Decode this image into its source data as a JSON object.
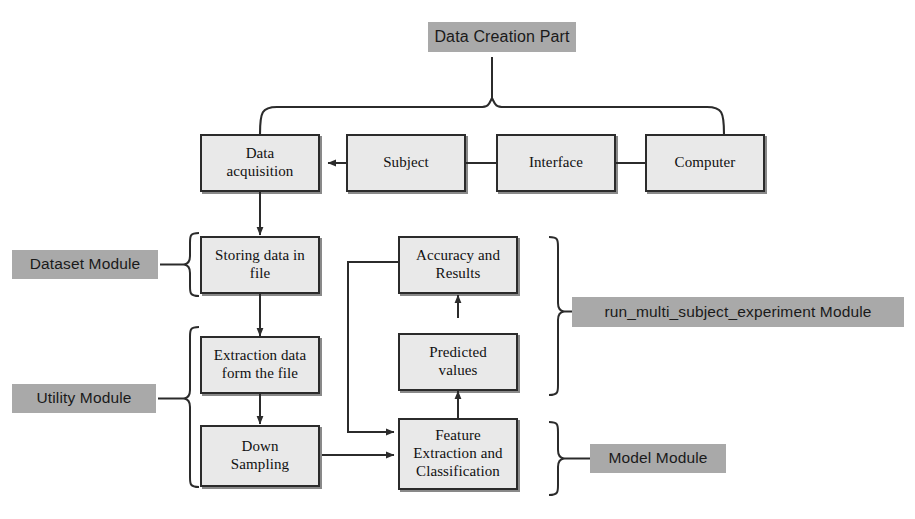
{
  "diagram": {
    "title": "Data Creation Part",
    "nodes": {
      "computer": "Computer",
      "interface": "Interface",
      "subject": "Subject",
      "data_acquisition_line1": "Data",
      "data_acquisition_line2": "acquisition",
      "storing_line1": "Storing data in",
      "storing_line2": "file",
      "extraction_line1": "Extraction data",
      "extraction_line2": "form the file",
      "down_sampling_line1": "Down",
      "down_sampling_line2": "Sampling",
      "feature_line1": "Feature",
      "feature_line2": "Extraction and",
      "feature_line3": "Classification",
      "predicted_line1": "Predicted",
      "predicted_line2": "values",
      "accuracy_line1": "Accuracy and",
      "accuracy_line2": "Results"
    },
    "modules": {
      "dataset": "Dataset Module",
      "utility": "Utility Module",
      "run_multi_subject": "run_multi_subject_experiment Module",
      "model": "Model Module"
    },
    "colors": {
      "module_label_bg": "#a9a9a9",
      "node_fill": "#e9e9e9",
      "stroke": "#2b2b2b",
      "page_bg": "#ffffff"
    }
  }
}
